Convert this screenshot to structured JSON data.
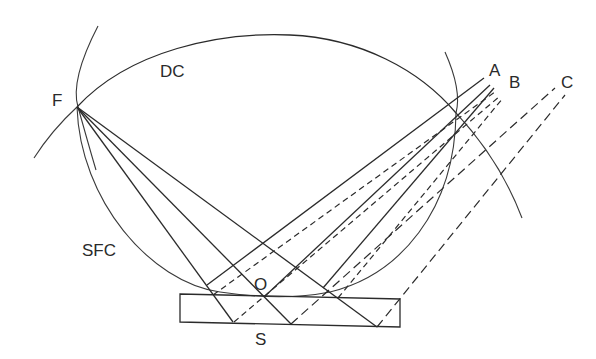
{
  "diagram": {
    "labels": {
      "F": "F",
      "DC": "DC",
      "A": "A",
      "B": "B",
      "C": "C",
      "SFC": "SFC",
      "O": "O",
      "S": "S"
    },
    "colors": {
      "line": "#2b2b2b",
      "background": "#ffffff"
    },
    "elements": [
      "diffractometer-circle-DC",
      "sample-focusing-circle-SFC",
      "sample-slab-S",
      "focus-point-F",
      "center-O",
      "diffracted-rays-A-B-C"
    ]
  }
}
